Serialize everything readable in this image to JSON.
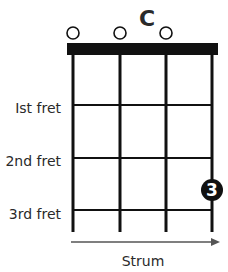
{
  "chord": {
    "name": "C",
    "open_strings": [
      1,
      2,
      3
    ],
    "fret_labels": [
      "Ist fret",
      "2nd fret",
      "3rd fret"
    ],
    "finger_markers": [
      {
        "string": 4,
        "fret": 3,
        "finger": "3"
      }
    ],
    "strum_label": "Strum"
  },
  "colors": {
    "ink": "#111111",
    "marker_fill": "#111111",
    "marker_text": "#ffffff",
    "arrow": "#555555"
  }
}
